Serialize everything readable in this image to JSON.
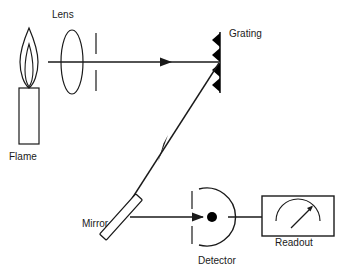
{
  "figure": {
    "type": "optical-schematic",
    "background_color": "#ffffff",
    "line_color": "#1a1a1a",
    "fill_color": "#000000",
    "width": 348,
    "height": 276
  },
  "labels": {
    "lens": "Lens",
    "flame": "Flame",
    "grating": "Grating",
    "mirror": "Mirror",
    "detector": "Detector",
    "readout": "Readout"
  },
  "components": [
    {
      "name": "candle-flame",
      "label": "Flame",
      "shape": "candle body rectangle with teardrop flame",
      "x": 30,
      "y": 90
    },
    {
      "name": "lens",
      "label": "Lens",
      "shape": "vertical ellipse",
      "x": 72,
      "y": 62
    },
    {
      "name": "entrance-slit",
      "label": "",
      "shape": "two vertical line segments with central gap",
      "x": 96,
      "y": 62
    },
    {
      "name": "grating",
      "label": "Grating",
      "shape": "vertical line with four filled sawtooth teeth facing left",
      "x": 220,
      "y": 62,
      "teeth": 4
    },
    {
      "name": "mirror",
      "label": "Mirror",
      "shape": "outlined rectangle tilted 45 degrees",
      "x": 121,
      "y": 217
    },
    {
      "name": "detector-slit",
      "label": "",
      "shape": "two vertical line segments with central gap",
      "x": 192,
      "y": 217
    },
    {
      "name": "detector",
      "label": "Detector",
      "shape": "semicircular arc opening left with filled dot",
      "x": 212,
      "y": 217
    },
    {
      "name": "readout",
      "label": "Readout",
      "shape": "rectangle containing analog gauge arc and needle",
      "x": 303,
      "y": 216
    }
  ],
  "beams": [
    {
      "name": "source-to-grating-beam",
      "from": "flame",
      "to": "grating",
      "direction": "rightward",
      "arrowheads": 1
    },
    {
      "name": "grating-to-mirror-beam",
      "from": "grating",
      "to": "mirror",
      "direction": "down-left diagonal",
      "arrowheads": 1
    },
    {
      "name": "mirror-to-detector-beam",
      "from": "mirror",
      "to": "detector",
      "direction": "rightward",
      "arrowheads": 1
    },
    {
      "name": "detector-to-readout-wire",
      "from": "detector",
      "to": "readout",
      "direction": "rightward",
      "arrowheads": 0
    }
  ]
}
